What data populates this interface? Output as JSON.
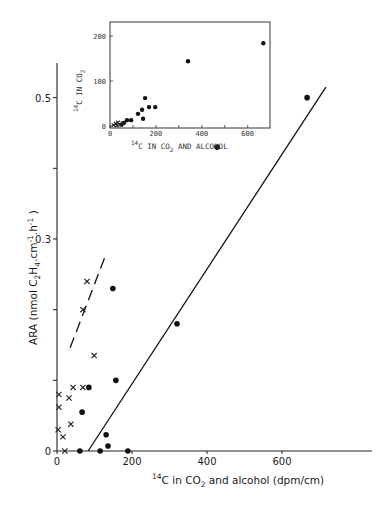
{
  "chart_data": [
    {
      "id": "main",
      "type": "scatter",
      "title": "",
      "xlabel": "14C in CO2 and alcohol (dpm/cm)",
      "xlabel_parts": {
        "sup": "14",
        "a": "C in CO",
        "sub": "2",
        "b": " and alcohol (dpm/cm)"
      },
      "ylabel": "ARA (nmol C2H4.cm-1.h-1)",
      "ylabel_parts": {
        "a": "ARA  (nmol  C",
        "sub1": "2",
        "b": "H",
        "sub2": "4",
        "c": ".cm",
        "sup1": "-1",
        "d": ".h",
        "sup2": "-1",
        "e": " )"
      },
      "xlim": [
        0,
        840
      ],
      "ylim": [
        0,
        0.55
      ],
      "xticks": [
        0,
        200,
        400,
        600
      ],
      "xtick_labels": [
        "0",
        "200",
        "400",
        "600"
      ],
      "yticks": [
        0,
        0.1,
        0.2,
        0.3,
        0.4,
        0.5
      ],
      "ytick_labels": [
        "0",
        "",
        "",
        "0.3",
        "",
        "0.5"
      ],
      "grid": false,
      "legend": null,
      "series": [
        {
          "name": "dots",
          "marker": "filled-circle",
          "points": [
            [
              667,
              0.5
            ],
            [
              427,
              0.43
            ],
            [
              320,
              0.18
            ],
            [
              149,
              0.23
            ],
            [
              157,
              0.1
            ],
            [
              85,
              0.09
            ],
            [
              67,
              0.055
            ],
            [
              131,
              0.023
            ],
            [
              136,
              0.007
            ],
            [
              61,
              0.0
            ],
            [
              115,
              0.0
            ],
            [
              189,
              0.0
            ]
          ]
        },
        {
          "name": "crosses",
          "marker": "x",
          "points": [
            [
              80,
              0.24
            ],
            [
              69,
              0.2
            ],
            [
              99,
              0.135
            ],
            [
              43,
              0.09
            ],
            [
              69,
              0.09
            ],
            [
              5,
              0.08
            ],
            [
              32,
              0.075
            ],
            [
              5,
              0.062
            ],
            [
              37,
              0.038
            ],
            [
              3,
              0.03
            ],
            [
              16,
              0.02
            ],
            [
              21,
              0.0
            ]
          ]
        }
      ],
      "lines": [
        {
          "name": "regression-dots",
          "style": "solid",
          "from": [
            83,
            0.0
          ],
          "to": [
            717,
            0.515
          ]
        },
        {
          "name": "regression-crosses",
          "style": "dashed",
          "from": [
            35,
            0.146
          ],
          "to": [
            131,
            0.279
          ]
        }
      ]
    },
    {
      "id": "inset",
      "type": "scatter",
      "title": "",
      "xlabel": "14C IN CO2 AND ALCOHOL",
      "xlabel_parts": {
        "sup": "14",
        "a": "C IN CO",
        "sub": "2",
        "b": " AND ALCOHOL"
      },
      "ylabel": "14C IN CO2",
      "ylabel_parts": {
        "sup": "14",
        "a": "C IN CO",
        "sub": "2"
      },
      "xlim": [
        0,
        700
      ],
      "ylim": [
        0,
        230
      ],
      "xticks": [
        0,
        200,
        400,
        600
      ],
      "xtick_labels": [
        "0",
        "200",
        "400",
        "600"
      ],
      "yticks": [
        0,
        100,
        200
      ],
      "ytick_labels": [
        "0",
        "100",
        "200"
      ],
      "grid": false,
      "series": [
        {
          "name": "dots",
          "marker": "filled-circle",
          "points": [
            [
              668,
              184
            ],
            [
              340,
              144
            ],
            [
              153,
              62
            ],
            [
              170,
              42
            ],
            [
              197,
              42
            ],
            [
              140,
              36
            ],
            [
              122,
              27
            ],
            [
              144,
              16
            ],
            [
              92,
              13
            ],
            [
              74,
              13
            ],
            [
              61,
              7
            ],
            [
              50,
              3
            ]
          ]
        },
        {
          "name": "crosses",
          "marker": "x",
          "points": [
            [
              15,
              2
            ],
            [
              25,
              5
            ],
            [
              35,
              8
            ],
            [
              45,
              3
            ],
            [
              30,
              1
            ],
            [
              55,
              6
            ]
          ]
        }
      ]
    }
  ]
}
